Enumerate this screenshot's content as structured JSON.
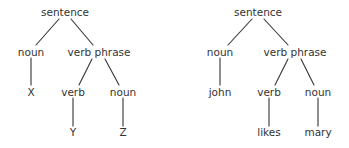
{
  "diagram": {
    "type": "parse-tree-pair",
    "line_color": "#333333",
    "text_color": "#333333",
    "trees": [
      {
        "id": "generic",
        "nodes": {
          "root": "sentence",
          "subject": "noun",
          "predicate": "verb phrase",
          "subject_leaf": "X",
          "verb": "verb",
          "object": "noun",
          "verb_leaf": "Y",
          "object_leaf": "Z"
        }
      },
      {
        "id": "example",
        "nodes": {
          "root": "sentence",
          "subject": "noun",
          "predicate": "verb phrase",
          "subject_leaf": "john",
          "verb": "verb",
          "object": "noun",
          "verb_leaf": "likes",
          "object_leaf": "mary"
        }
      }
    ],
    "edges": [
      [
        "root",
        "subject"
      ],
      [
        "root",
        "predicate"
      ],
      [
        "subject",
        "subject_leaf"
      ],
      [
        "predicate",
        "verb"
      ],
      [
        "predicate",
        "object"
      ],
      [
        "verb",
        "verb_leaf"
      ],
      [
        "object",
        "object_leaf"
      ]
    ]
  }
}
